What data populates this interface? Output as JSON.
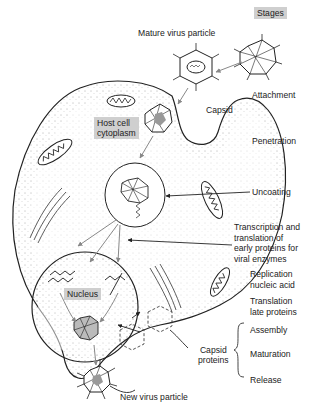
{
  "title": "Stages",
  "labels": {
    "mature_virus_particle": "Mature virus particle",
    "capsid": "Capsid",
    "host_cell_cytoplasm_line1": "Host cell",
    "host_cell_cytoplasm_line2": "cytoplasm",
    "nucleus": "Nucleus",
    "capsid_proteins_line1": "Capsid",
    "capsid_proteins_line2": "proteins",
    "new_virus_particle": "New virus particle"
  },
  "stages": [
    {
      "lines": [
        "Attachment"
      ]
    },
    {
      "lines": [
        "Penetration"
      ]
    },
    {
      "lines": [
        "Uncoating"
      ]
    },
    {
      "lines": [
        "Transcription and",
        "translation of",
        "early proteins for",
        "viral enzymes"
      ]
    },
    {
      "lines": [
        "Replication",
        "nucleic acid"
      ]
    },
    {
      "lines": [
        "Translation",
        "late proteins"
      ]
    },
    {
      "lines": [
        "Assembly"
      ]
    },
    {
      "lines": [
        "Maturation"
      ]
    },
    {
      "lines": [
        "Release"
      ]
    }
  ],
  "colors": {
    "label_box": "#cfcfcf",
    "line": "#222222",
    "arrow_gray": "#888888"
  }
}
